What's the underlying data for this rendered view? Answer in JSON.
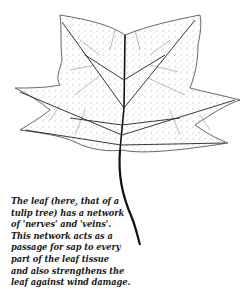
{
  "figure": {
    "ink_color": "#111111",
    "background_color": "#ffffff"
  },
  "caption": {
    "lines": [
      "The leaf (here, that of a",
      "tulip tree) has a network",
      "of 'nerves' and 'veins'.",
      "This network acts as a",
      "passage for sap to every",
      "part of the leaf tissue",
      "and also strengthens the",
      "leaf against wind damage."
    ]
  }
}
